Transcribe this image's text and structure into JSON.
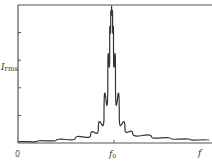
{
  "chart_data": {
    "type": "line",
    "title": "",
    "xlabel": "f",
    "ylabel": "I_rms",
    "ylabel_main": "I",
    "ylabel_sub": "rms",
    "x_tick_labels": [
      {
        "label": "0",
        "position": 0
      },
      {
        "label": "f0",
        "main": "f",
        "sub": "0",
        "position": 0.49
      }
    ],
    "y_ticks_unlabeled": 4,
    "grid": false,
    "legend": null,
    "xlim": [
      0,
      1
    ],
    "ylim": [
      0,
      1
    ],
    "series": [
      {
        "name": "I_rms",
        "color": "#333333",
        "x": [
          0.0,
          0.1,
          0.2,
          0.3,
          0.38,
          0.42,
          0.45,
          0.47,
          0.48,
          0.485,
          0.49,
          0.495,
          0.5,
          0.51,
          0.53,
          0.56,
          0.6,
          0.7,
          0.8,
          0.9,
          1.0
        ],
        "y": [
          0.0,
          0.005,
          0.012,
          0.025,
          0.05,
          0.09,
          0.18,
          0.45,
          0.75,
          0.9,
          1.0,
          0.9,
          0.75,
          0.45,
          0.18,
          0.09,
          0.06,
          0.035,
          0.025,
          0.018,
          0.012
        ]
      }
    ]
  },
  "labels": {
    "ylabel_main": "I",
    "ylabel_sub": "rms",
    "x_origin": "0",
    "x_f0_main": "f",
    "x_f0_sub": "0",
    "x_axis": "f"
  }
}
